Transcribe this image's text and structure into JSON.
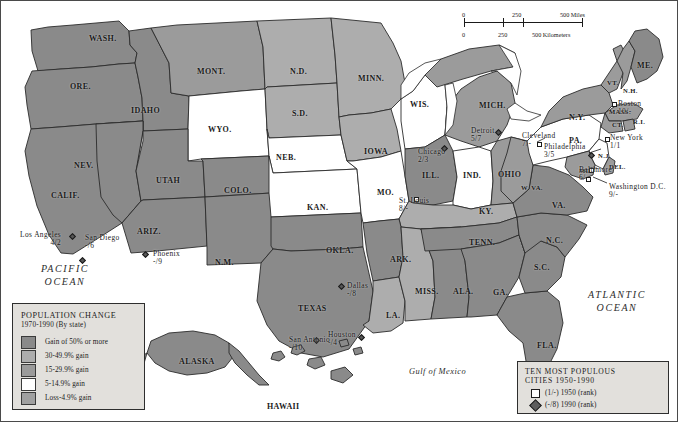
{
  "map": {
    "title": "United States population change 1970-1990 with ten most populous cities 1950-1990",
    "ocean_labels": {
      "pacific": "PACIFIC\nOCEAN",
      "pacific_line1": "PACIFIC",
      "pacific_line2": "OCEAN",
      "atlantic_line1": "ATLANTIC",
      "atlantic_line2": "OCEAN",
      "gulf": "Gulf of Mexico"
    },
    "scale": {
      "miles_0": "0",
      "miles_250": "250",
      "miles_500": "500 Miles",
      "km_0": "0",
      "km_250": "250",
      "km_500": "500 Kilometers"
    },
    "colors": {
      "class_50_plus": "#8e8e8e",
      "class_30_49": "#a8a8a8",
      "class_15_29": "#9a9a9a",
      "class_5_14": "#ffffff",
      "class_loss_4": "#9e9e9e",
      "water": "#ffffff",
      "border": "#2e2e2e",
      "legend_bg": "#e2e0dc"
    }
  },
  "population_legend": {
    "title_line1": "POPULATION CHANGE",
    "title_line2": "1970-1990 (By state)",
    "classes": [
      {
        "label": "Gain of 50% or more",
        "color": "#8a8a8a"
      },
      {
        "label": "30-49.9% gain",
        "color": "#adadad"
      },
      {
        "label": "15-29.9% gain",
        "color": "#9b9b9b"
      },
      {
        "label": "5-14.9% gain",
        "color": "#ffffff"
      },
      {
        "label": "Loss-4.9% gain",
        "color": "#a0a0a0"
      }
    ]
  },
  "city_legend": {
    "title_line1": "TEN MOST POPULOUS",
    "title_line2": "CITIES 1950-1990",
    "entries": [
      {
        "symbol": "square",
        "label": "(1/-) 1950 (rank)"
      },
      {
        "symbol": "diamond",
        "label": "(-/8) 1990 (rank)"
      }
    ]
  },
  "states": [
    {
      "abbr": "WASH.",
      "x": 88,
      "y": 33,
      "size": "sm"
    },
    {
      "abbr": "ORE.",
      "x": 69,
      "y": 81,
      "size": "sm"
    },
    {
      "abbr": "IDAHO",
      "x": 130,
      "y": 105,
      "size": "sm"
    },
    {
      "abbr": "MONT.",
      "x": 196,
      "y": 66,
      "size": "sm"
    },
    {
      "abbr": "WYO.",
      "x": 207,
      "y": 124,
      "size": "sm"
    },
    {
      "abbr": "N.D.",
      "x": 289,
      "y": 66,
      "size": "sm"
    },
    {
      "abbr": "S.D.",
      "x": 291,
      "y": 108,
      "size": "sm"
    },
    {
      "abbr": "NEB.",
      "x": 275,
      "y": 152,
      "size": "sm"
    },
    {
      "abbr": "KAN.",
      "x": 306,
      "y": 202,
      "size": "sm"
    },
    {
      "abbr": "MINN.",
      "x": 357,
      "y": 73,
      "size": "sm"
    },
    {
      "abbr": "IOWA",
      "x": 363,
      "y": 146,
      "size": "sm"
    },
    {
      "abbr": "MO.",
      "x": 376,
      "y": 187,
      "size": "sm"
    },
    {
      "abbr": "WIS.",
      "x": 409,
      "y": 99,
      "size": "sm"
    },
    {
      "abbr": "ILL.",
      "x": 421,
      "y": 170,
      "size": "sm"
    },
    {
      "abbr": "MICH.",
      "x": 478,
      "y": 100,
      "size": "sm"
    },
    {
      "abbr": "IND.",
      "x": 462,
      "y": 170,
      "size": "sm"
    },
    {
      "abbr": "OHIO",
      "x": 497,
      "y": 169,
      "size": "sm"
    },
    {
      "abbr": "KY.",
      "x": 478,
      "y": 206,
      "size": "sm"
    },
    {
      "abbr": "NEV.",
      "x": 73,
      "y": 160,
      "size": "sm"
    },
    {
      "abbr": "UTAH",
      "x": 155,
      "y": 175,
      "size": "sm"
    },
    {
      "abbr": "COLO.",
      "x": 223,
      "y": 185,
      "size": "sm"
    },
    {
      "abbr": "CALIF.",
      "x": 50,
      "y": 190,
      "size": "sm"
    },
    {
      "abbr": "ARIZ.",
      "x": 136,
      "y": 226,
      "size": "sm"
    },
    {
      "abbr": "N.M.",
      "x": 214,
      "y": 257,
      "size": "sm"
    },
    {
      "abbr": "OKLA.",
      "x": 325,
      "y": 245,
      "size": "sm"
    },
    {
      "abbr": "TEXAS",
      "x": 297,
      "y": 303,
      "size": "sm"
    },
    {
      "abbr": "ARK.",
      "x": 389,
      "y": 254,
      "size": "sm"
    },
    {
      "abbr": "LA.",
      "x": 385,
      "y": 310,
      "size": "sm"
    },
    {
      "abbr": "MISS.",
      "x": 414,
      "y": 286,
      "size": "sm"
    },
    {
      "abbr": "ALA.",
      "x": 452,
      "y": 286,
      "size": "sm"
    },
    {
      "abbr": "TENN.",
      "x": 468,
      "y": 237,
      "size": "sm"
    },
    {
      "abbr": "GA.",
      "x": 492,
      "y": 287,
      "size": "sm"
    },
    {
      "abbr": "FLA.",
      "x": 536,
      "y": 340,
      "size": "sm"
    },
    {
      "abbr": "S.C.",
      "x": 533,
      "y": 262,
      "size": "sm"
    },
    {
      "abbr": "N.C.",
      "x": 545,
      "y": 235,
      "size": "sm"
    },
    {
      "abbr": "VA.",
      "x": 551,
      "y": 200,
      "size": "sm"
    },
    {
      "abbr": "W. VA.",
      "x": 520,
      "y": 183,
      "size": "xs"
    },
    {
      "abbr": "PA.",
      "x": 568,
      "y": 135,
      "size": "sm"
    },
    {
      "abbr": "N.Y.",
      "x": 568,
      "y": 112,
      "size": "sm"
    },
    {
      "abbr": "VT.",
      "x": 606,
      "y": 78,
      "size": "xs"
    },
    {
      "abbr": "N.H.",
      "x": 622,
      "y": 86,
      "size": "xs"
    },
    {
      "abbr": "ME.",
      "x": 636,
      "y": 60,
      "size": "sm"
    },
    {
      "abbr": "MASS.",
      "x": 608,
      "y": 107,
      "size": "xs"
    },
    {
      "abbr": "R.I.",
      "x": 632,
      "y": 117,
      "size": "xs"
    },
    {
      "abbr": "CT.",
      "x": 611,
      "y": 120,
      "size": "xs"
    },
    {
      "abbr": "N.J.",
      "x": 597,
      "y": 151,
      "size": "xs"
    },
    {
      "abbr": "DEL.",
      "x": 608,
      "y": 162,
      "size": "xs"
    },
    {
      "abbr": "MD.",
      "x": 578,
      "y": 166,
      "size": "xs"
    },
    {
      "abbr": "ALASKA",
      "x": 178,
      "y": 356,
      "size": "sm"
    },
    {
      "abbr": "HAWAII",
      "x": 266,
      "y": 401,
      "size": "sm"
    }
  ],
  "cities": [
    {
      "name": "Boston",
      "rank": "10/-",
      "lx": 617,
      "ly": 99,
      "dx": 611,
      "dy": 101,
      "sym": "square",
      "align": "lft"
    },
    {
      "name": "New York",
      "rank": "1/1",
      "lx": 609,
      "ly": 133,
      "dx": 604,
      "dy": 136,
      "sym": "square",
      "align": "lft"
    },
    {
      "name": "Philadelphia",
      "rank": "3/5",
      "lx": 543,
      "ly": 142,
      "dx": 588,
      "dy": 152,
      "sym": "diamond",
      "align": "lft"
    },
    {
      "name": "Baltimore",
      "rank": "6/-",
      "lx": 578,
      "ly": 165,
      "dx": 588,
      "dy": 167,
      "sym": "square",
      "align": "lft"
    },
    {
      "name": "Washington D.C.",
      "rank": "9/-",
      "lx": 608,
      "ly": 182,
      "dx": 585,
      "dy": 176,
      "sym": "square",
      "align": "lft"
    },
    {
      "name": "Cleveland",
      "rank": "7/-",
      "lx": 521,
      "ly": 131,
      "dx": 536,
      "dy": 141,
      "sym": "square",
      "align": "lft"
    },
    {
      "name": "Detroit",
      "rank": "5/7",
      "lx": 470,
      "ly": 126,
      "dx": 495,
      "dy": 129,
      "sym": "diamond",
      "align": "lft"
    },
    {
      "name": "Chicago",
      "rank": "2/3",
      "lx": 417,
      "ly": 147,
      "dx": 441,
      "dy": 145,
      "sym": "diamond",
      "align": "lft"
    },
    {
      "name": "St. Louis",
      "rank": "8/-",
      "lx": 398,
      "ly": 196,
      "dx": 413,
      "dy": 196,
      "sym": "square",
      "align": "lft"
    },
    {
      "name": "Los Angeles",
      "rank": "4/2",
      "lx": 19,
      "ly": 230,
      "dx": 69,
      "dy": 233,
      "sym": "diamond",
      "align": "la"
    },
    {
      "name": "San Diego",
      "rank": "-/6",
      "lx": 84,
      "ly": 233,
      "dx": 79,
      "dy": 257,
      "sym": "diamond",
      "align": "lft"
    },
    {
      "name": "Phoenix",
      "rank": "-/9",
      "lx": 152,
      "ly": 249,
      "dx": 142,
      "dy": 251,
      "sym": "diamond",
      "align": "lft"
    },
    {
      "name": "Dallas",
      "rank": "-/8",
      "lx": 346,
      "ly": 281,
      "dx": 338,
      "dy": 283,
      "sym": "diamond",
      "align": "lft"
    },
    {
      "name": "Houston",
      "rank": "-/4",
      "lx": 327,
      "ly": 330,
      "dx": 358,
      "dy": 334,
      "sym": "diamond",
      "align": "lft"
    },
    {
      "name": "San Antonio",
      "rank": "-/10",
      "lx": 288,
      "ly": 335,
      "dx": 313,
      "dy": 337,
      "sym": "diamond",
      "align": "lft"
    }
  ]
}
